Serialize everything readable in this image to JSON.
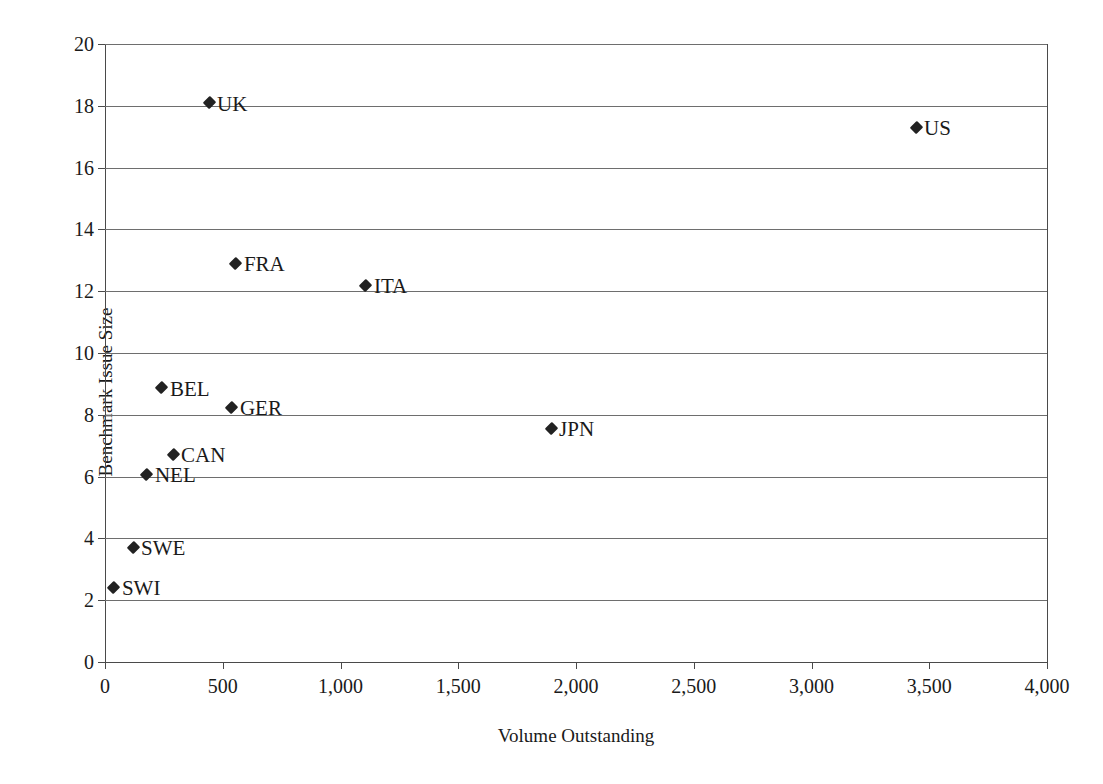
{
  "chart_data": {
    "type": "scatter",
    "title": "",
    "xlabel": "Volume Outstanding",
    "ylabel": "Benchmark Issue Size",
    "xlim": [
      0,
      4000
    ],
    "ylim": [
      0,
      20
    ],
    "xticks": [
      "0",
      "500",
      "1,000",
      "1,500",
      "2,000",
      "2,500",
      "3,000",
      "3,500",
      "4,000"
    ],
    "xtick_values": [
      0,
      500,
      1000,
      1500,
      2000,
      2500,
      3000,
      3500,
      4000
    ],
    "yticks": [
      "0",
      "2",
      "4",
      "6",
      "8",
      "10",
      "12",
      "14",
      "16",
      "18",
      "20"
    ],
    "ytick_values": [
      0,
      2,
      4,
      6,
      8,
      10,
      12,
      14,
      16,
      18,
      20
    ],
    "grid": "horizontal",
    "legend": "none",
    "marker": "diamond",
    "marker_color": "#222222",
    "points": [
      {
        "label": "UK",
        "x": 442,
        "y": 18.1,
        "label_pos": "right"
      },
      {
        "label": "US",
        "x": 3444,
        "y": 17.3,
        "label_pos": "right"
      },
      {
        "label": "FRA",
        "x": 556,
        "y": 12.9,
        "label_pos": "right"
      },
      {
        "label": "ITA",
        "x": 1108,
        "y": 12.2,
        "label_pos": "right"
      },
      {
        "label": "BEL",
        "x": 242,
        "y": 8.87,
        "label_pos": "right"
      },
      {
        "label": "GER",
        "x": 539,
        "y": 8.25,
        "label_pos": "right"
      },
      {
        "label": "JPN",
        "x": 1894,
        "y": 7.57,
        "label_pos": "right"
      },
      {
        "label": "CAN",
        "x": 289,
        "y": 6.72,
        "label_pos": "right"
      },
      {
        "label": "NEL",
        "x": 178,
        "y": 6.08,
        "label_pos": "right"
      },
      {
        "label": "SWE",
        "x": 119,
        "y": 3.72,
        "label_pos": "right"
      },
      {
        "label": "SWI",
        "x": 38,
        "y": 2.42,
        "label_pos": "right"
      }
    ]
  }
}
